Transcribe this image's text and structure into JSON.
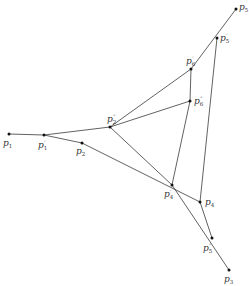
{
  "diagram": {
    "type": "geometric-point-configuration",
    "points": [
      {
        "id": "p5",
        "base": "p",
        "sub": "5",
        "prime": "",
        "x": 236,
        "y": 9,
        "lx": 239,
        "ly": 3
      },
      {
        "id": "p5p",
        "base": "p",
        "sub": "5",
        "prime": "′",
        "x": 217,
        "y": 38,
        "lx": 220,
        "ly": 33
      },
      {
        "id": "p6p",
        "base": "p",
        "sub": "6",
        "prime": "′",
        "x": 191,
        "y": 69,
        "lx": 186,
        "ly": 56
      },
      {
        "id": "p6pp",
        "base": "p",
        "sub": "6",
        "prime": "″",
        "x": 190,
        "y": 101,
        "lx": 194,
        "ly": 96
      },
      {
        "id": "p2pp",
        "base": "p",
        "sub": "2",
        "prime": "″",
        "x": 110,
        "y": 127,
        "lx": 107,
        "ly": 114
      },
      {
        "id": "p1",
        "base": "p",
        "sub": "1",
        "prime": "",
        "x": 9,
        "y": 134,
        "lx": 3,
        "ly": 139
      },
      {
        "id": "p1p",
        "base": "p",
        "sub": "1",
        "prime": "′",
        "x": 44,
        "y": 135,
        "lx": 38,
        "ly": 140
      },
      {
        "id": "p2",
        "base": "p",
        "sub": "2",
        "prime": "",
        "x": 82,
        "y": 143,
        "lx": 76,
        "ly": 147
      },
      {
        "id": "p4p",
        "base": "p",
        "sub": "4",
        "prime": "′",
        "x": 172,
        "y": 185,
        "lx": 164,
        "ly": 189
      },
      {
        "id": "p4",
        "base": "p",
        "sub": "4",
        "prime": "",
        "x": 200,
        "y": 202,
        "lx": 205,
        "ly": 198
      },
      {
        "id": "p5pp",
        "base": "p",
        "sub": "5",
        "prime": "″",
        "x": 212,
        "y": 238,
        "lx": 203,
        "ly": 243
      },
      {
        "id": "p3",
        "base": "p",
        "sub": "3",
        "prime": "",
        "x": 229,
        "y": 270,
        "lx": 224,
        "ly": 275
      }
    ],
    "segments": [
      [
        "p1",
        "p1p"
      ],
      [
        "p1p",
        "p2pp"
      ],
      [
        "p1p",
        "p2"
      ],
      [
        "p2",
        "p4"
      ],
      [
        "p2pp",
        "p6pp"
      ],
      [
        "p2pp",
        "p6p"
      ],
      [
        "p2pp",
        "p4p"
      ],
      [
        "p6p",
        "p5"
      ],
      [
        "p6p",
        "p6pp"
      ],
      [
        "p5p",
        "p4"
      ],
      [
        "p6pp",
        "p4p"
      ],
      [
        "p4p",
        "p3"
      ],
      [
        "p4",
        "p5pp"
      ]
    ]
  }
}
